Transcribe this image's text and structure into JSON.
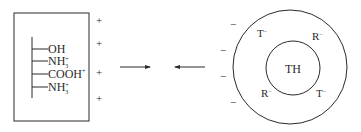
{
  "left_panel": {
    "groups": [
      {
        "base": "OH",
        "sub": "",
        "sup": ""
      },
      {
        "base": "NH",
        "sub": "3",
        "sup": "+"
      },
      {
        "base": "COOH",
        "sub": "",
        "sup": "+"
      },
      {
        "base": "NH",
        "sub": "3",
        "sup": "+"
      }
    ],
    "charges": [
      "+",
      "+",
      "+",
      "+"
    ]
  },
  "arrows": {
    "right_arrow": "→",
    "left_arrow": "←"
  },
  "right_panel": {
    "outer_charges": [
      "−",
      "−",
      "−",
      "−"
    ],
    "ring_labels": [
      {
        "base": "T",
        "sup": "−"
      },
      {
        "base": "R",
        "sup": "−"
      },
      {
        "base": "R",
        "sup": "−"
      },
      {
        "base": "T",
        "sup": "−"
      }
    ],
    "center_label": "TH"
  },
  "colors": {
    "stroke": "#2a2a2a",
    "background": "#ffffff"
  }
}
